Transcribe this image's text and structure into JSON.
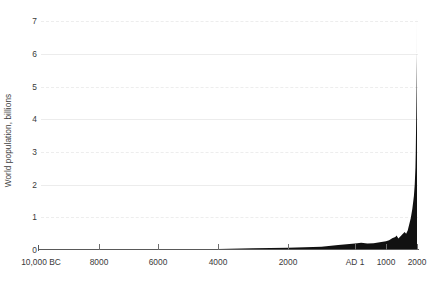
{
  "chart_data": {
    "type": "area",
    "title": "",
    "xlabel": "",
    "ylabel": "World population, billions",
    "ylim": [
      0,
      7.4
    ],
    "xlim": [
      -10000,
      2000
    ],
    "grid": true,
    "grid_axis": "y",
    "legend": "none",
    "series_color": "#111111",
    "y_ticks": [
      {
        "value": 7,
        "label": "7",
        "gridstyle": "dashed"
      },
      {
        "value": 6,
        "label": "6",
        "gridstyle": "solid"
      },
      {
        "value": 5,
        "label": "5",
        "gridstyle": "dashed"
      },
      {
        "value": 4,
        "label": "4",
        "gridstyle": "solid"
      },
      {
        "value": 3,
        "label": "3",
        "gridstyle": "dashed"
      },
      {
        "value": 2,
        "label": "2",
        "gridstyle": "solid"
      },
      {
        "value": 1,
        "label": "1",
        "gridstyle": "dashed"
      },
      {
        "value": 0,
        "label": "0",
        "gridstyle": "none"
      }
    ],
    "x_ticks": [
      {
        "label": "10,000 BC",
        "pos_px": 41
      },
      {
        "label": "8000",
        "pos_px": 99
      },
      {
        "label": "6000",
        "pos_px": 158
      },
      {
        "label": "4000",
        "pos_px": 218
      },
      {
        "label": "2000",
        "pos_px": 288
      },
      {
        "label": "AD 1",
        "pos_px": 355
      },
      {
        "label": "1000",
        "pos_px": 386
      },
      {
        "label": "2000",
        "pos_px": 417
      }
    ],
    "x": [
      -10000,
      -9000,
      -8000,
      -7000,
      -6000,
      -5000,
      -4000,
      -3000,
      -2000,
      -1000,
      -500,
      1,
      200,
      400,
      600,
      800,
      1000,
      1100,
      1200,
      1300,
      1340,
      1400,
      1500,
      1600,
      1650,
      1700,
      1750,
      1800,
      1850,
      1900,
      1927,
      1950,
      1960,
      1974,
      1987,
      1999,
      2000
    ],
    "values": [
      0.004,
      0.005,
      0.007,
      0.01,
      0.015,
      0.02,
      0.03,
      0.05,
      0.07,
      0.1,
      0.15,
      0.2,
      0.22,
      0.2,
      0.21,
      0.24,
      0.27,
      0.3,
      0.36,
      0.4,
      0.44,
      0.35,
      0.45,
      0.55,
      0.5,
      0.6,
      0.79,
      0.98,
      1.26,
      1.65,
      2.0,
      2.52,
      3.0,
      4.0,
      5.0,
      6.0,
      7.2
    ],
    "annotations": []
  }
}
